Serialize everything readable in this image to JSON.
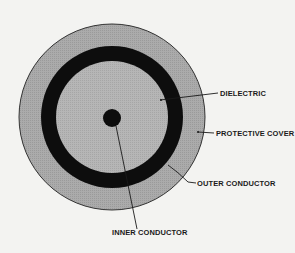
{
  "diagram": {
    "labels": {
      "dielectric": "DIELECTRIC",
      "protective_cover": "PROTECTIVE COVER",
      "outer_conductor": "OUTER CONDUCTOR",
      "inner_conductor": "INNER CONDUCTOR"
    },
    "colors": {
      "background": "#f3f3f1",
      "protective_cover": "#a9a9a9",
      "outer_conductor": "#0d0d0d",
      "dielectric": "#b4b4b4",
      "inner_conductor": "#0d0d0d"
    }
  }
}
